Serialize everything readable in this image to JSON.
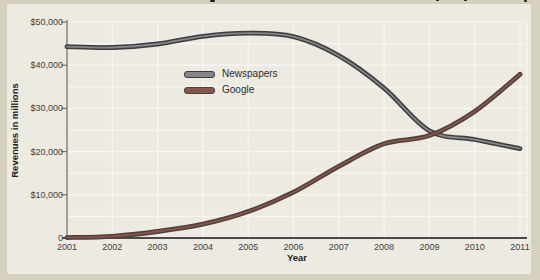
{
  "page": {
    "outer_background": "#d6d1bf",
    "card_background": "#edeae1",
    "gridline_color": "#f8f7f3",
    "axis_color": "#4a4a4a"
  },
  "chart_data": {
    "type": "line",
    "x": [
      2001,
      2002,
      2003,
      2004,
      2005,
      2006,
      2007,
      2008,
      2009,
      2010,
      2011
    ],
    "x_tick_labels": [
      "2001",
      "2002",
      "2003",
      "2004",
      "2005",
      "2006",
      "2007",
      "2008",
      "2009",
      "2010",
      "2011"
    ],
    "y_tick_labels": [
      "0",
      "$10,000",
      "$20,000",
      "$30,000",
      "$40,000",
      "$50,000"
    ],
    "ylim": [
      0,
      50000
    ],
    "y_major_step": 10000,
    "y_grid_step": 5000,
    "grid": true,
    "xlabel": "Year",
    "ylabel": "Revenues in millions",
    "legend_position": "upper-center-left",
    "series": [
      {
        "name": "Newspapers",
        "color": "#3d3d3f",
        "highlight": "#85858a",
        "values": [
          44300,
          44100,
          44900,
          46700,
          47400,
          46600,
          42200,
          34700,
          24800,
          22800,
          20700
        ]
      },
      {
        "name": "Google",
        "color": "#523f3a",
        "highlight": "#86564c",
        "values": [
          100,
          400,
          1500,
          3200,
          6100,
          10600,
          16600,
          21800,
          23700,
          29300,
          37900
        ]
      }
    ]
  }
}
